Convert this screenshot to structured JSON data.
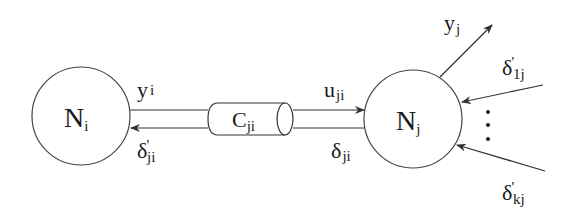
{
  "diagram": {
    "title": "",
    "colors": {
      "stroke": "#333333",
      "text": "#1a1a1a",
      "background": "#ffffff"
    },
    "nodes": {
      "ni": {
        "main": "N",
        "sub": "i"
      },
      "nj": {
        "main": "N",
        "sub": "j"
      },
      "channel": {
        "main": "C",
        "sub": "ji"
      }
    },
    "edges": {
      "y_i": {
        "main": "y",
        "sub": "i"
      },
      "delta_prime_ji": {
        "main": "δ",
        "prime": "'",
        "sub": "ji"
      },
      "u_ji": {
        "main": "u",
        "sub": "ji"
      },
      "delta_ji": {
        "main": "δ",
        "sub": "ji"
      },
      "y_j": {
        "main": "y",
        "sub": "j"
      },
      "delta_prime_1j": {
        "main": "δ",
        "prime": "'",
        "sub": "1j"
      },
      "delta_prime_kj": {
        "main": "δ",
        "prime": "'",
        "sub": "kj"
      }
    },
    "ellipsis": "⋮"
  }
}
